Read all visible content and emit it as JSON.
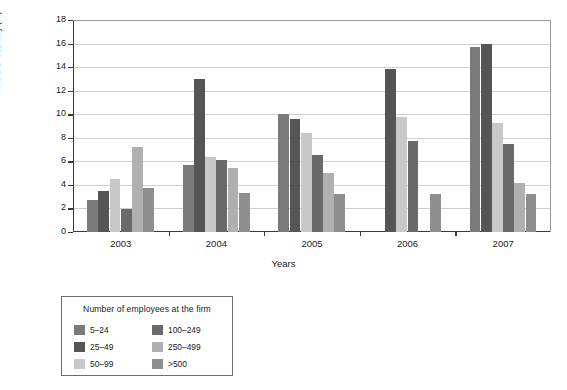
{
  "chart_data": {
    "type": "bar",
    "title": "",
    "subtitle": "",
    "xlabel": "Years",
    "ylabel": "R and D intensity (%)",
    "categories": [
      "2003",
      "2004",
      "2005",
      "2006",
      "2007"
    ],
    "ylim": [
      0,
      18
    ],
    "yticks": [
      0,
      2,
      4,
      6,
      8,
      10,
      12,
      14,
      16,
      18
    ],
    "grid": true,
    "legend_position": "below-left",
    "legend_title": "Number of employees at the firm",
    "series": [
      {
        "name": "5–24",
        "color": "#7b7b7b",
        "values": [
          2.75,
          5.65,
          10.0,
          null,
          15.75
        ]
      },
      {
        "name": "25–49",
        "color": "#555555",
        "values": [
          3.45,
          12.95,
          9.6,
          13.85,
          16.0
        ]
      },
      {
        "name": "50–99",
        "color": "#c8c8c8",
        "values": [
          4.5,
          6.35,
          8.4,
          9.8,
          9.25
        ]
      },
      {
        "name": "100–249",
        "color": "#6a6a6a",
        "values": [
          1.95,
          6.1,
          6.55,
          7.75,
          7.45
        ]
      },
      {
        "name": "250–499",
        "color": "#b0b0b0",
        "values": [
          7.2,
          5.45,
          5.05,
          null,
          4.2
        ]
      },
      {
        "name": ">500",
        "color": "#8e8e8e",
        "values": [
          3.7,
          3.35,
          3.2,
          3.2,
          3.2
        ]
      }
    ]
  },
  "legend": {
    "title": "Number of employees at the firm",
    "entries": [
      {
        "label": "5–24",
        "color": "#7b7b7b"
      },
      {
        "label": "100–249",
        "color": "#6a6a6a"
      },
      {
        "label": "25–49",
        "color": "#555555"
      },
      {
        "label": "250–499",
        "color": "#b0b0b0"
      },
      {
        "label": "50–99",
        "color": "#c8c8c8"
      },
      {
        "label": ">500",
        "color": "#8e8e8e"
      }
    ]
  }
}
